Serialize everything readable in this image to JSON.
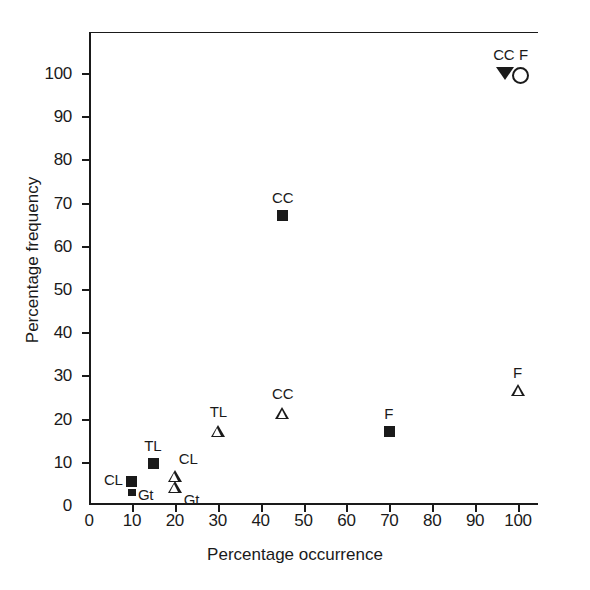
{
  "chart_data": {
    "type": "scatter",
    "title": "",
    "xlabel": "Percentage occurrence",
    "ylabel": "Percentage frequency",
    "xlim": [
      0,
      100
    ],
    "ylim": [
      0,
      110
    ],
    "xticks": [
      0,
      10,
      20,
      30,
      40,
      50,
      60,
      70,
      80,
      90,
      100
    ],
    "xtick_labels": [
      "0",
      "10",
      "20",
      "30",
      "40",
      "50",
      "60",
      "70",
      "80",
      "90",
      "100"
    ],
    "yticks": [
      0,
      10,
      20,
      30,
      40,
      50,
      60,
      70,
      80,
      90,
      100
    ],
    "ytick_labels": [
      "0",
      "10",
      "20",
      "30",
      "40",
      "50",
      "60",
      "70",
      "80",
      "90",
      "100"
    ],
    "grid": false,
    "legend": "none",
    "axis_color": "#1a1a1a",
    "marker_color": "#1a1a1a",
    "background": "#ffffff",
    "points": [
      {
        "label": "CC",
        "x": 97,
        "y": 100,
        "marker": "filled-down-triangle",
        "label_dx": -12,
        "label_dy": -26
      },
      {
        "label": "F",
        "x": 100,
        "y": 100,
        "marker": "open-circle",
        "label_dx": 1,
        "label_dy": -26
      },
      {
        "label": "CC",
        "x": 45,
        "y": 67,
        "marker": "filled-square",
        "label_dx": -10,
        "label_dy": -26
      },
      {
        "label": "F",
        "x": 100,
        "y": 26.5,
        "marker": "open-triangle",
        "label_dx": -5,
        "label_dy": -26
      },
      {
        "label": "CC",
        "x": 45,
        "y": 21,
        "marker": "open-triangle",
        "label_dx": -10,
        "label_dy": -28
      },
      {
        "label": "TL",
        "x": 30,
        "y": 17,
        "marker": "open-triangle",
        "label_dx": -8,
        "label_dy": -28
      },
      {
        "label": "F",
        "x": 70,
        "y": 17,
        "marker": "filled-square",
        "label_dx": -5,
        "label_dy": -26
      },
      {
        "label": "TL",
        "x": 15,
        "y": 9.5,
        "marker": "filled-square",
        "label_dx": -9,
        "label_dy": -26
      },
      {
        "label": "CL",
        "x": 20,
        "y": 6.5,
        "marker": "open-triangle",
        "label_dx": 4,
        "label_dy": -26
      },
      {
        "label": "CL",
        "x": 10,
        "y": 5.5,
        "marker": "filled-square",
        "label_dx": -28,
        "label_dy": -9
      },
      {
        "label": "Gt",
        "x": 20,
        "y": 4,
        "marker": "open-triangle",
        "label_dx": 9,
        "label_dy": 4
      },
      {
        "label": "Gt",
        "x": 10,
        "y": 3,
        "marker": "small-filled-square",
        "label_dx": 6,
        "label_dy": -5
      }
    ]
  }
}
